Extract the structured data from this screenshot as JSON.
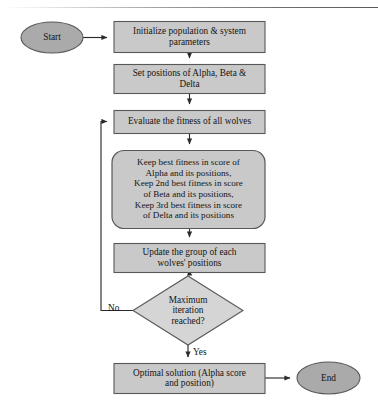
{
  "diagram": {
    "colors": {
      "process_fill": "#c9c9c9",
      "terminator_fill": "#aaaaaa",
      "decision_fill": "#d5d5d5",
      "stroke": "#585858",
      "text": "#141414",
      "background": "#ffffff"
    },
    "nodes": [
      {
        "id": "start",
        "type": "terminator",
        "label": "Start",
        "x": 21,
        "y": 22,
        "w": 62,
        "h": 31
      },
      {
        "id": "initialize",
        "type": "process",
        "label": "Initialize population & system\nparameters",
        "x": 114,
        "y": 21,
        "w": 151,
        "h": 31
      },
      {
        "id": "set-positions",
        "type": "process",
        "label": "Set positions of Alpha, Beta &\nDelta",
        "x": 114,
        "y": 64,
        "w": 151,
        "h": 29
      },
      {
        "id": "evaluate-fitness",
        "type": "process",
        "label": "Evaluate the fitness of all wolves",
        "x": 114,
        "y": 110,
        "w": 151,
        "h": 23
      },
      {
        "id": "keep-best",
        "type": "process-rounded",
        "label": "Keep best fitness in score of\nAlpha and its positions,\nKeep 2nd best fitness in score\nof Beta and its positions,\nKeep 3rd best fitness in score\nof Delta and its positions",
        "x": 112,
        "y": 150,
        "w": 153,
        "h": 78
      },
      {
        "id": "update-group",
        "type": "process",
        "label": "Update the group of each\nwolves' positions",
        "x": 114,
        "y": 243,
        "w": 151,
        "h": 29
      },
      {
        "id": "max-iteration",
        "type": "decision",
        "label": "Maximum\niteration\nreached?",
        "x": 133,
        "y": 276,
        "w": 110,
        "h": 69
      },
      {
        "id": "optimal-solution",
        "type": "process",
        "label": "Optimal solution (Alpha score\nand position)",
        "x": 114,
        "y": 363,
        "w": 151,
        "h": 30
      },
      {
        "id": "end",
        "type": "terminator",
        "label": "End",
        "x": 297,
        "y": 362,
        "w": 63,
        "h": 32
      }
    ],
    "edges": [
      {
        "id": "start-to-initialize",
        "from": "start",
        "to": "initialize",
        "label": ""
      },
      {
        "id": "initialize-to-set-positions",
        "from": "initialize",
        "to": "set-positions",
        "label": ""
      },
      {
        "id": "set-positions-to-evaluate",
        "from": "set-positions",
        "to": "evaluate-fitness",
        "label": ""
      },
      {
        "id": "evaluate-to-keep-best",
        "from": "evaluate-fitness",
        "to": "keep-best",
        "label": ""
      },
      {
        "id": "keep-best-to-update",
        "from": "keep-best",
        "to": "update-group",
        "label": ""
      },
      {
        "id": "update-to-decision",
        "from": "update-group",
        "to": "max-iteration",
        "label": ""
      },
      {
        "id": "decision-no-loop",
        "from": "max-iteration",
        "to": "evaluate-fitness",
        "label": "No"
      },
      {
        "id": "decision-yes",
        "from": "max-iteration",
        "to": "optimal-solution",
        "label": "Yes"
      },
      {
        "id": "optimal-to-end",
        "from": "optimal-solution",
        "to": "end",
        "label": ""
      }
    ],
    "edge_labels": {
      "no": "No",
      "yes": "Yes"
    }
  }
}
